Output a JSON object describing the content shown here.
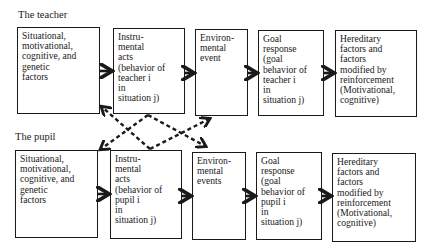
{
  "diagram": {
    "rows": [
      {
        "label": "The teacher",
        "boxes": [
          {
            "id": "t-situational",
            "text": "Situational,\nmotivational,\ncognitive, and\ngenetic\nfactors"
          },
          {
            "id": "t-instrumental",
            "text": "Instru-\nmental\nacts\n(behavior of\nteacher i\nin\nsituation j)"
          },
          {
            "id": "t-environmental",
            "text": "Environ-\nmental\nevent"
          },
          {
            "id": "t-goal",
            "text": "Goal\nresponse\n(goal\nbehavior of\nteacher i\nin\nsituation j)"
          },
          {
            "id": "t-hereditary",
            "text": "Hereditary\nfactors and\nfactors\nmodified by\nreinforcement\n(Motivational,\ncognitive)"
          }
        ]
      },
      {
        "label": "The pupil",
        "boxes": [
          {
            "id": "p-situational",
            "text": "Situational,\nmotivational,\ncognitive, and\ngenetic\nfactors"
          },
          {
            "id": "p-instrumental",
            "text": "Instru-\nmental\nacts\n(behavior of\npupil i\nin\nsituation j)"
          },
          {
            "id": "p-environmental",
            "text": "Environ-\nmental\nevents"
          },
          {
            "id": "p-goal",
            "text": "Goal\nresponse\n(goal\nbehavior of\npupil i\nin\nsituation j)"
          },
          {
            "id": "p-hereditary",
            "text": "Hereditary\nfactors and\nfactors\nmodified by\nreinforcement\n(Motivational,\ncognitive)"
          }
        ]
      }
    ],
    "solid_arrows": [
      {
        "from": "t-situational",
        "to": "t-instrumental"
      },
      {
        "from": "t-instrumental",
        "to": "t-environmental"
      },
      {
        "from": "t-environmental",
        "to": "t-goal"
      },
      {
        "from": "t-goal",
        "to": "t-hereditary"
      },
      {
        "from": "p-situational",
        "to": "p-instrumental"
      },
      {
        "from": "p-instrumental",
        "to": "p-environmental"
      },
      {
        "from": "p-environmental",
        "to": "p-goal"
      },
      {
        "from": "p-goal",
        "to": "p-hereditary"
      }
    ],
    "dashed_arrows": [
      {
        "from": "p-instrumental",
        "to": "t-situational"
      },
      {
        "from": "t-instrumental",
        "to": "p-situational"
      },
      {
        "from": "t-instrumental",
        "to": "p-environmental"
      },
      {
        "from": "p-instrumental",
        "to": "t-environmental"
      }
    ],
    "colors": {
      "ink": "#1a1a1a",
      "background": "#ffffff"
    }
  }
}
